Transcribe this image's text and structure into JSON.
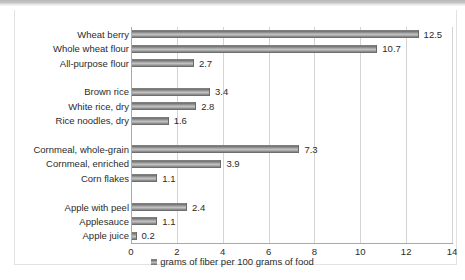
{
  "chart_data": {
    "type": "bar",
    "orientation": "horizontal",
    "title": "",
    "xlabel": "",
    "ylabel": "",
    "xlim": [
      0,
      14
    ],
    "xticks": [
      0,
      2,
      4,
      6,
      8,
      10,
      12,
      14
    ],
    "grid": true,
    "legend_position": "bottom",
    "legend": [
      "grams of fiber per 100 grams of food"
    ],
    "series_name": "grams of fiber per 100 grams of food",
    "categories": [
      "Wheat berry",
      "Whole wheat flour",
      "All-purpose flour",
      "",
      "Brown rice",
      "White rice, dry",
      "Rice noodles, dry",
      "",
      "Cornmeal, whole-grain",
      "Cornmeal, enriched",
      "Corn flakes",
      "",
      "Apple with peel",
      "Applesauce",
      "Apple juice"
    ],
    "values": [
      12.5,
      10.7,
      2.7,
      null,
      3.4,
      2.8,
      1.6,
      null,
      7.3,
      3.9,
      1.1,
      null,
      2.4,
      1.1,
      0.2
    ],
    "data_labels": [
      "12.5",
      "10.7",
      "2.7",
      "",
      "3.4",
      "2.8",
      "1.6",
      "",
      "7.3",
      "3.9",
      "1.1",
      "",
      "2.4",
      "1.1",
      "0.2"
    ],
    "bar_color": "#8d8d8d",
    "gridline_color": "#d4d4d4",
    "axis_color": "#a9a9a9"
  },
  "legend": {
    "label": "grams of fiber per 100 grams of food",
    "swatch_name": "legend-color-swatch"
  }
}
